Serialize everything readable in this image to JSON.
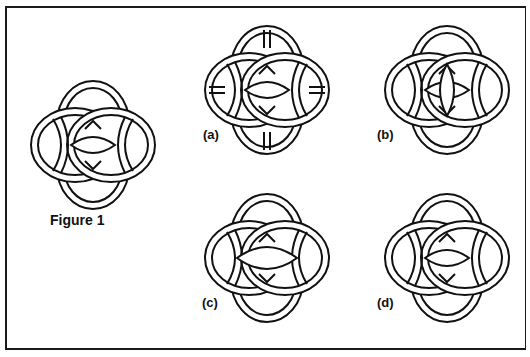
{
  "figure": {
    "caption": "Figure 1",
    "border_color": "#1a1a1a",
    "stroke_color": "#111111",
    "main_knot": {
      "name": "figure-1-knot",
      "cx": 92,
      "cy": 145
    },
    "variants": [
      {
        "id": "a",
        "label": "(a)",
        "cx": 267,
        "cy": 90,
        "interior": "cross-bars"
      },
      {
        "id": "b",
        "label": "(b)",
        "cx": 447,
        "cy": 90,
        "interior": "vertical-lens"
      },
      {
        "id": "c",
        "label": "(c)",
        "cx": 267,
        "cy": 258,
        "interior": "wide-lens"
      },
      {
        "id": "d",
        "label": "(d)",
        "cx": 447,
        "cy": 258,
        "interior": "standard"
      }
    ]
  }
}
